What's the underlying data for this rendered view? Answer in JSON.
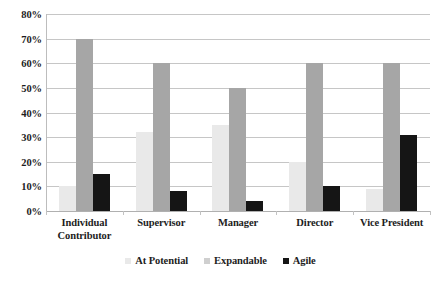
{
  "chart_data": {
    "type": "bar",
    "title": "",
    "xlabel": "",
    "ylabel": "",
    "ylim": [
      0,
      80
    ],
    "ytick_labels": [
      "80%",
      "70%",
      "60%",
      "50%",
      "40%",
      "30%",
      "20%",
      "10%",
      "0%"
    ],
    "ytick_values": [
      80,
      70,
      60,
      50,
      40,
      30,
      20,
      10,
      0
    ],
    "grid": true,
    "legend_position": "bottom",
    "categories": [
      "Individual Contributor",
      "Supervisor",
      "Manager",
      "Director",
      "Vice President"
    ],
    "category_lines": [
      [
        "Individual",
        "Contributor"
      ],
      [
        "Supervisor"
      ],
      [
        "Manager"
      ],
      [
        "Director"
      ],
      [
        "Vice President"
      ]
    ],
    "series": [
      {
        "name": "At Potential",
        "color": "#e9e9e9",
        "values": [
          10,
          32,
          35,
          20,
          9
        ]
      },
      {
        "name": "Expandable",
        "color": "#a6a6a6",
        "values": [
          70,
          60,
          50,
          60,
          60
        ]
      },
      {
        "name": "Agile",
        "color": "#151515",
        "values": [
          15,
          8,
          4,
          10,
          31
        ]
      }
    ]
  },
  "legend": {
    "items": [
      {
        "label": "At Potential"
      },
      {
        "label": "Expandable"
      },
      {
        "label": "Agile"
      }
    ]
  }
}
